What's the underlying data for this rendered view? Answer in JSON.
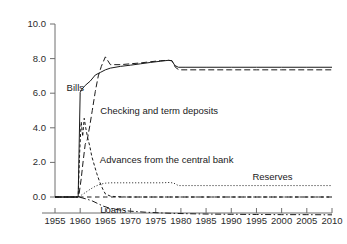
{
  "chart_data": {
    "type": "line",
    "title": "",
    "subtitle": "",
    "xlabel": "",
    "ylabel": "",
    "xlim": [
      1953.5,
      2011.5
    ],
    "ylim": [
      -1.6,
      10.6
    ],
    "grid": false,
    "legend_position": "inline-annotations",
    "background_color": "#ffffff",
    "axis_color": "#6e6e6e",
    "line_color": "#1a1a1a",
    "x_ticks": [
      1955,
      1960,
      1965,
      1970,
      1975,
      1980,
      1985,
      1990,
      1995,
      2000,
      2005,
      2010
    ],
    "x_tick_labels": [
      "1955",
      "1960",
      "1965",
      "1970",
      "1975",
      "1980",
      "1985",
      "1990",
      "1995",
      "2000",
      "2005",
      "2010"
    ],
    "y_ticks": [
      0.0,
      2.0,
      4.0,
      6.0,
      8.0,
      10.0
    ],
    "y_tick_labels": [
      "0.0",
      "2.0",
      "4.0",
      "6.0",
      "8.0",
      "10.0"
    ],
    "series": [
      {
        "name": "Bills",
        "label": "Bills",
        "style": "solid",
        "x": [
          1955,
          1957,
          1959,
          1959.6,
          1960.0,
          1960.4,
          1961,
          1962,
          1963,
          1964,
          1965,
          1966,
          1968,
          1970,
          1972,
          1974,
          1976,
          1977.5,
          1978.2,
          1978.8,
          1979.5,
          1981,
          1985,
          1990,
          1995,
          2000,
          2005,
          2010
        ],
        "y": [
          0.0,
          0.0,
          0.0,
          0.0,
          6.05,
          6.25,
          6.45,
          6.7,
          7.05,
          7.2,
          7.35,
          7.45,
          7.55,
          7.62,
          7.7,
          7.78,
          7.85,
          7.9,
          7.88,
          7.6,
          7.5,
          7.5,
          7.5,
          7.5,
          7.5,
          7.5,
          7.5,
          7.5
        ]
      },
      {
        "name": "Checking and term deposits",
        "label": "Checking and term deposits",
        "style": "dashed",
        "x": [
          1955,
          1957,
          1959,
          1959.7,
          1960.2,
          1960.6,
          1961.0,
          1961.4,
          1961.9,
          1962.4,
          1963.0,
          1963.6,
          1964.2,
          1965,
          1966,
          1968,
          1970,
          1972,
          1974,
          1976,
          1977.5,
          1978.2,
          1978.9,
          1979.6,
          1981,
          1985,
          1990,
          1995,
          2000,
          2005,
          2010
        ],
        "y": [
          0.0,
          0.0,
          0.0,
          0.0,
          1.05,
          2.1,
          3.05,
          3.3,
          4.1,
          5.0,
          6.1,
          7.0,
          7.55,
          8.1,
          7.65,
          7.65,
          7.7,
          7.75,
          7.82,
          7.88,
          7.9,
          7.88,
          7.5,
          7.35,
          7.35,
          7.35,
          7.35,
          7.35,
          7.35,
          7.35,
          7.35
        ]
      },
      {
        "name": "Advances from the central bank",
        "label": "Advances from the central bank",
        "style": "short-dash",
        "x": [
          1955,
          1957,
          1959,
          1959.6,
          1959.9,
          1960.2,
          1960.5,
          1960.8,
          1961.1,
          1961.5,
          1961.9,
          1962.3,
          1962.8,
          1963.3,
          1963.9,
          1964.5,
          1965,
          1966,
          1967,
          1969,
          1972,
          1976,
          1978.5,
          1980,
          1985,
          1990,
          1995,
          2000,
          2005,
          2010
        ],
        "y": [
          0.0,
          0.0,
          0.0,
          0.0,
          2.6,
          4.35,
          3.5,
          4.55,
          4.0,
          3.4,
          2.95,
          2.35,
          1.85,
          1.35,
          0.85,
          0.45,
          0.18,
          0.05,
          0.02,
          0.0,
          0.0,
          0.0,
          0.0,
          0.0,
          0.0,
          0.0,
          0.0,
          0.0,
          0.0,
          0.0
        ]
      },
      {
        "name": "Reserves",
        "label": "Reserves",
        "style": "dotted",
        "x": [
          1955,
          1957,
          1959,
          1959.8,
          1960.3,
          1961,
          1962,
          1963,
          1964,
          1965,
          1966,
          1968,
          1970,
          1973,
          1976,
          1977.8,
          1978.6,
          1979.5,
          1981,
          1985,
          1990,
          1995,
          2000,
          2005,
          2010
        ],
        "y": [
          0.0,
          0.0,
          0.0,
          0.0,
          0.12,
          0.25,
          0.45,
          0.62,
          0.74,
          0.8,
          0.82,
          0.82,
          0.82,
          0.82,
          0.82,
          0.84,
          0.8,
          0.66,
          0.66,
          0.66,
          0.66,
          0.66,
          0.66,
          0.66,
          0.66
        ]
      },
      {
        "name": "Zero line series",
        "label": "",
        "style": "medium-dash",
        "x": [
          1955,
          1960,
          1965,
          1970,
          1975,
          1980,
          1985,
          1990,
          1995,
          2000,
          2005,
          2010
        ],
        "y": [
          0.0,
          0.0,
          0.0,
          0.0,
          0.0,
          0.0,
          0.0,
          0.0,
          0.0,
          0.0,
          0.0,
          0.0
        ]
      },
      {
        "name": "Loans",
        "label": "Loans",
        "style": "dash-dot",
        "x": [
          1955,
          1957,
          1959,
          1959.8,
          1960.5,
          1961.5,
          1962.5,
          1963.5,
          1964.5,
          1966,
          1968,
          1970,
          1973,
          1976,
          1979,
          1982,
          1986,
          1990,
          1995,
          2000,
          2005,
          2010
        ],
        "y": [
          0.0,
          0.0,
          0.0,
          0.0,
          -0.06,
          -0.14,
          -0.24,
          -0.38,
          -0.52,
          -0.66,
          -0.76,
          -0.82,
          -0.88,
          -0.92,
          -0.95,
          -0.97,
          -0.99,
          -1.0,
          -1.01,
          -1.02,
          -1.02,
          -1.03
        ]
      }
    ],
    "annotations": [
      {
        "text": "Bills",
        "x": 1957.3,
        "y": 6.3
      },
      {
        "text": "Checking and term deposits",
        "x": 1964.0,
        "y": 4.95
      },
      {
        "text": "Advances from the central bank",
        "x": 1963.9,
        "y": 2.15
      },
      {
        "text": "Reserves",
        "x": 1994.2,
        "y": 1.18
      },
      {
        "text": "Loans",
        "x": 1964.0,
        "y": -0.73
      }
    ]
  }
}
